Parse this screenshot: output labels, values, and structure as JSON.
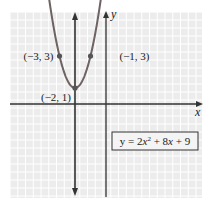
{
  "chart_data": {
    "type": "line",
    "title": "",
    "xlabel": "x",
    "ylabel": "y",
    "equation": "y = 2x² + 8x + 9",
    "equation_parts": {
      "pre": "y = 2",
      "x1": "x",
      "sup": "2",
      "mid": " + 8",
      "x2": "x",
      "post": " + 9"
    },
    "xlim": [
      -6.1,
      6.2
    ],
    "ylim": [
      -5.8,
      5.8
    ],
    "grid": true,
    "axis_of_symmetry": {
      "x": -2,
      "style": "line with arrows"
    },
    "points": [
      {
        "x": -3,
        "y": 3,
        "label": "(−3, 3)"
      },
      {
        "x": -2,
        "y": 1,
        "label": "(−2, 1)"
      },
      {
        "x": -1,
        "y": 3,
        "label": "(−1, 3)"
      }
    ],
    "series": [
      {
        "name": "y = 2x² + 8x + 9",
        "function": "2x^2+8x+9",
        "x_range": [
          -3.8,
          -0.2
        ]
      }
    ]
  },
  "colors": {
    "background": "#ececec",
    "gridline": "#ffffff",
    "axis": "#333333",
    "curve": "#6e6262",
    "point": "#555555"
  }
}
